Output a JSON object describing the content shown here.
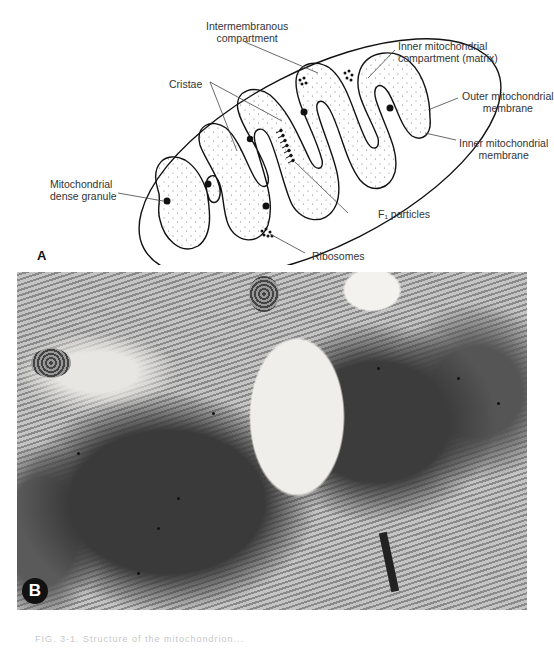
{
  "figure": {
    "panel_a": {
      "letter": "A",
      "labels": {
        "intermembranous": [
          "Intermembranous",
          "compartment"
        ],
        "inner_compartment": [
          "Inner mitochondrial",
          "compartment (matrix)"
        ],
        "cristae": "Cristae",
        "outer_membrane": [
          "Outer mitochondrial",
          "membrane"
        ],
        "inner_membrane": [
          "Inner mitochondrial",
          "membrane"
        ],
        "dense_granule": [
          "Mitochondrial",
          "dense granule"
        ],
        "f1_particles": "F₁ particles",
        "ribosomes": "Ribosomes"
      }
    },
    "panel_b": {
      "letter": "B",
      "description": "Electron micrograph of mitochondria in muscle tissue"
    },
    "caption": "FIG. 3-1. Structure of the mitochondrion..."
  }
}
